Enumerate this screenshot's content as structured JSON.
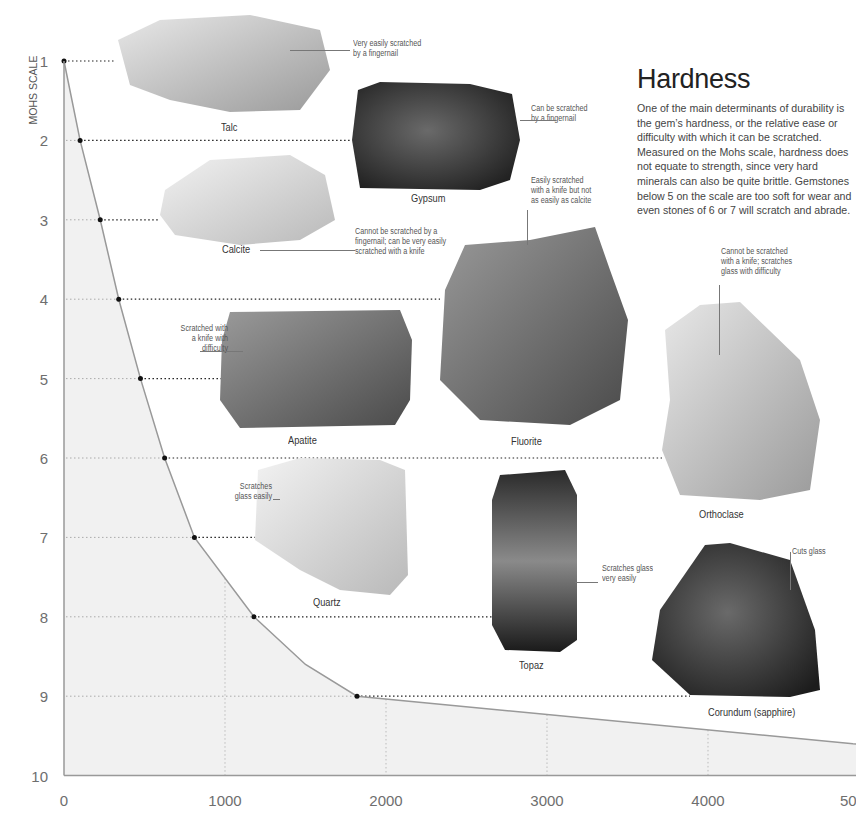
{
  "header": {
    "title": "Hardness",
    "body": "One of the main determinants of durability is the gem’s hardness, or the relative ease or difficulty with which it can be scratched. Measured on the Mohs scale, hardness does not equate to strength, since very hard minerals can also be quite brittle. Gemstones below 5 on the scale are too soft for wear and even stones of 6 or 7 will scratch and abrade."
  },
  "chart_data": {
    "type": "area",
    "title": "Hardness",
    "xlabel": "",
    "ylabel": "MOHS SCALE",
    "xlim": [
      0,
      5000
    ],
    "ylim": [
      1,
      10
    ],
    "y_inverted": true,
    "x_ticks": [
      "0",
      "1000",
      "2000",
      "3000",
      "4000",
      "50"
    ],
    "y_ticks": [
      "1",
      "2",
      "3",
      "4",
      "5",
      "6",
      "7",
      "8",
      "9",
      "10"
    ],
    "grid": "dotted vertical at x ticks, dotted horizontal at mineral points",
    "series": [
      {
        "name": "absolute hardness curve",
        "points": [
          {
            "x": 0,
            "y": 1
          },
          {
            "x": 100,
            "y": 2
          },
          {
            "x": 225,
            "y": 3
          },
          {
            "x": 340,
            "y": 4
          },
          {
            "x": 475,
            "y": 5
          },
          {
            "x": 625,
            "y": 6
          },
          {
            "x": 810,
            "y": 7
          },
          {
            "x": 1180,
            "y": 8
          },
          {
            "x": 1500,
            "y": 8.6
          },
          {
            "x": 1820,
            "y": 9
          },
          {
            "x": 4900,
            "y": 9.6
          }
        ]
      }
    ],
    "minerals": [
      {
        "name": "Talc",
        "mohs": 1,
        "x": 0,
        "note": "Very easily scratched\nby a fingernail"
      },
      {
        "name": "Gypsum",
        "mohs": 2,
        "x": 100,
        "note": "Can be scratched\nby a fingernail"
      },
      {
        "name": "Calcite",
        "mohs": 3,
        "x": 225,
        "note": "Cannot be scratched by a\nfingernail; can be very easily\nscratched with a knife"
      },
      {
        "name": "Fluorite",
        "mohs": 4,
        "x": 340,
        "note": "Easily scratched\nwith a knife but not\nas easily as calcite"
      },
      {
        "name": "Apatite",
        "mohs": 5,
        "x": 475,
        "note": "Scratched with\na knife with\ndifficulty"
      },
      {
        "name": "Orthoclase",
        "mohs": 6,
        "x": 625,
        "note": "Cannot be scratched\nwith a knife; scratches\nglass with difficulty"
      },
      {
        "name": "Quartz",
        "mohs": 7,
        "x": 810,
        "note": "Scratches\nglass easily"
      },
      {
        "name": "Topaz",
        "mohs": 8,
        "x": 1180,
        "note": "Scratches glass\nvery easily"
      },
      {
        "name": "Corundum (sapphire)",
        "mohs": 9,
        "x": 1820,
        "note": "Cuts glass"
      }
    ]
  }
}
